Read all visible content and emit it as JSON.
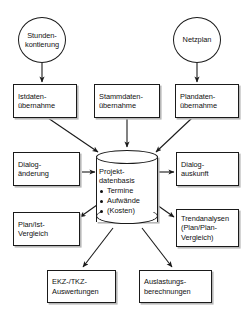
{
  "diagram": {
    "canvas": {
      "width": 252,
      "height": 322
    },
    "line_color": "#1a1a1a",
    "shadow_color": "#b8b8b8",
    "background": "#ffffff"
  },
  "sources": [
    {
      "id": "stundenkontierung",
      "shape": "circle",
      "label": "Stunden-\nkontierung"
    },
    {
      "id": "netzplan",
      "shape": "circle",
      "label": "Netzplan"
    }
  ],
  "inputs": [
    {
      "id": "istdaten",
      "shape": "box",
      "label": "Istdaten-\nübernahme"
    },
    {
      "id": "stammdaten",
      "shape": "box",
      "label": "Stammdaten-\nübernahme"
    },
    {
      "id": "plandaten",
      "shape": "box",
      "label": "Plandaten-\nübernahme"
    },
    {
      "id": "dialogaenderung",
      "shape": "box",
      "label": "Dialog-\nänderung"
    }
  ],
  "database": {
    "id": "projektdatenbasis",
    "shape": "cylinder",
    "title": "Projekt-\ndatenbasis",
    "bullets": [
      "Termine",
      "Aufwände",
      "(Kosten)"
    ]
  },
  "outputs": [
    {
      "id": "dialogauskunft",
      "shape": "box",
      "label": "Dialog-\nauskunft"
    },
    {
      "id": "planist",
      "shape": "box",
      "label": "Plan/Ist-\nVergleich"
    },
    {
      "id": "trendanalysen",
      "shape": "box",
      "label": "Trendanalysen\n(Plan/Plan-\nVergleich)"
    },
    {
      "id": "ekztkz",
      "shape": "box",
      "label": "EKZ-/TKZ-\nAuswertungen"
    },
    {
      "id": "auslastung",
      "shape": "box",
      "label": "Auslastungs-\nberechnungen"
    }
  ],
  "connectors": [
    {
      "from": "stundenkontierung",
      "to": "istdaten",
      "direction": "down"
    },
    {
      "from": "netzplan",
      "to": "plandaten",
      "direction": "down"
    },
    {
      "from": "istdaten",
      "to": "projektdatenbasis",
      "direction": "diagonal-down-right"
    },
    {
      "from": "stammdaten",
      "to": "projektdatenbasis",
      "direction": "down"
    },
    {
      "from": "plandaten",
      "to": "projektdatenbasis",
      "direction": "diagonal-down-left"
    },
    {
      "from": "dialogaenderung",
      "to": "projektdatenbasis",
      "direction": "right"
    },
    {
      "from": "projektdatenbasis",
      "to": "dialogauskunft",
      "direction": "right"
    },
    {
      "from": "projektdatenbasis",
      "to": "planist",
      "direction": "diagonal-down-left"
    },
    {
      "from": "projektdatenbasis",
      "to": "trendanalysen",
      "direction": "diagonal-down-right"
    },
    {
      "from": "projektdatenbasis",
      "to": "ekztkz",
      "direction": "diagonal-down-left"
    },
    {
      "from": "projektdatenbasis",
      "to": "auslastung",
      "direction": "diagonal-down-right"
    }
  ]
}
